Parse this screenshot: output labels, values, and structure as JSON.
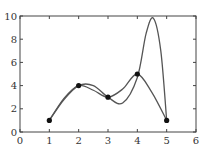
{
  "chart_data": {
    "type": "line",
    "title": "",
    "xlabel": "",
    "ylabel": "",
    "xlim": [
      0,
      6
    ],
    "ylim": [
      0,
      10
    ],
    "xticks": [
      "0",
      "1",
      "2",
      "3",
      "4",
      "5",
      "6"
    ],
    "yticks": [
      "0",
      "2",
      "4",
      "6",
      "8",
      "10"
    ],
    "grid": false,
    "legend": null,
    "points": {
      "x": [
        1,
        2,
        3,
        4,
        5
      ],
      "y": [
        1,
        4,
        3,
        5,
        1
      ]
    },
    "series": [
      {
        "name": "smooth interpolation",
        "x": [
          1,
          1.5,
          2,
          2.5,
          3,
          3.5,
          4,
          4.5,
          5
        ],
        "y": [
          1,
          2.9,
          4,
          3.6,
          3,
          3.7,
          5,
          3.4,
          1
        ]
      },
      {
        "name": "overshooting interpolation",
        "x": [
          1,
          1.5,
          2,
          2.5,
          3,
          3.5,
          4,
          4.3,
          4.55,
          4.8,
          5
        ],
        "y": [
          1,
          2.8,
          4,
          4.0,
          3,
          2.5,
          4.7,
          8.5,
          9.8,
          7.0,
          1
        ]
      }
    ],
    "colors": {
      "line": "#555555",
      "marker": "#111111",
      "axis": "#444444"
    }
  }
}
